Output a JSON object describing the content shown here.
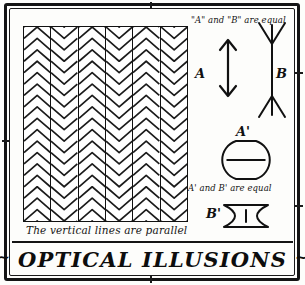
{
  "plate": {
    "title_text": "OPTICAL ILLUSIONS",
    "title_flourish_left": "~",
    "title_flourish_right": "~",
    "background_color": "#fdfdfb",
    "ink_color": "#141414"
  },
  "zollner": {
    "caption": "The vertical lines are parallel",
    "column_count": 6,
    "chevrons_per_column": 17,
    "directions": [
      "up",
      "down",
      "up",
      "down",
      "up",
      "down"
    ]
  },
  "muller_lyer": {
    "note": "\"A\" and \"B\" are equal",
    "figure_a_label": "A",
    "figure_b_label": "B",
    "figure_a_type": "arrow-inward-heads",
    "figure_b_type": "arrow-outward-fins"
  },
  "circle_bowtie": {
    "note": "A' and B' are equal",
    "figure_a_label": "A'",
    "figure_b_label": "B'",
    "figure_a_type": "circle-with-horizontal-diameter",
    "figure_b_type": "bowtie-with-vertical-bar"
  },
  "chart_data": {
    "type": "diagram",
    "title": "OPTICAL ILLUSIONS",
    "figures": [
      {
        "name": "zollner-chevron-panel",
        "caption": "The vertical lines are parallel",
        "columns": 6,
        "chevrons_per_column": 17
      },
      {
        "name": "muller-lyer-pair",
        "caption": "\"A\" and \"B\" are equal",
        "labels": [
          "A",
          "B"
        ]
      },
      {
        "name": "circle-bowtie-pair",
        "caption": "A' and B' are equal",
        "labels": [
          "A'",
          "B'"
        ]
      }
    ]
  }
}
